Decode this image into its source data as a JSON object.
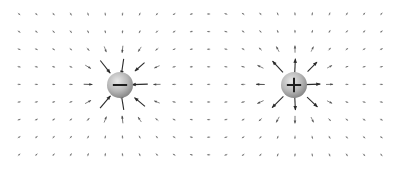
{
  "diagram": {
    "type": "electric-field-vector-plot",
    "width": 405,
    "height": 172,
    "grid": {
      "x_start": 19,
      "x_step": 17.25,
      "columns": 22,
      "y_start": 14,
      "y_step": 17.6,
      "rows": 9
    },
    "charges": [
      {
        "name": "negative-charge",
        "sign": "-",
        "q": -1,
        "x": 120,
        "y": 85,
        "radius": 13,
        "label": "−"
      },
      {
        "name": "positive-charge",
        "sign": "+",
        "q": 1,
        "x": 294,
        "y": 85,
        "radius": 13,
        "label": "+"
      }
    ],
    "arrow": {
      "color": "#2a2a2a",
      "max_length": 16,
      "min_length": 3,
      "scale": 9000
    },
    "charge_colors": {
      "light": "#e8e8e8",
      "mid": "#b8b8b8",
      "dark": "#8a8a8a",
      "symbol": "#1e1e1e"
    }
  }
}
